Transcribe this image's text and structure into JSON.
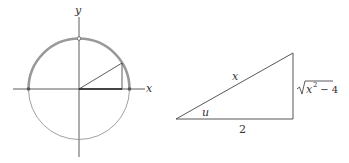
{
  "figure_left": {
    "description": "Unit circle with upper semicircle highlighted",
    "x_axis_label": "x",
    "y_axis_label": "y",
    "colors": {
      "axis": "#333333",
      "circle": "#777777",
      "highlight": "#999999",
      "point": "#555555"
    }
  },
  "figure_right": {
    "description": "Right triangle",
    "hypotenuse_label": "x",
    "angle_label": "u",
    "base_label": "2",
    "opposite_label_radicand": "x",
    "opposite_label_exp": "2",
    "opposite_label_rest": " − 4"
  }
}
